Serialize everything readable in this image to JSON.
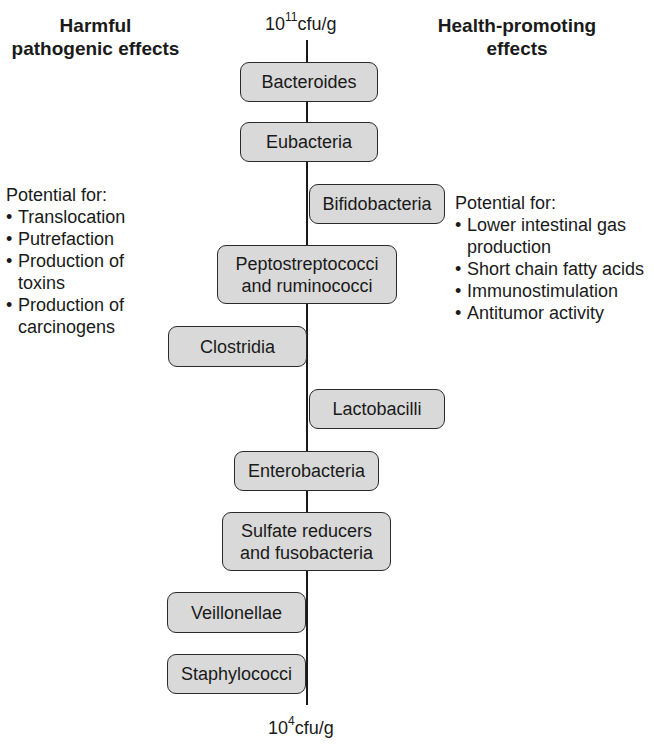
{
  "headings": {
    "left": "Harmful pathogenic effects",
    "right": "Health-promoting effects"
  },
  "axis": {
    "top": {
      "base": "10",
      "exp": "11",
      "unit": "cfu/g"
    },
    "bottom": {
      "base": "10",
      "exp": "4",
      "unit": "cfu/g"
    }
  },
  "bacteria": [
    {
      "label": "Bacteroides",
      "side": "center"
    },
    {
      "label": "Eubacteria",
      "side": "center"
    },
    {
      "label": "Bifidobacteria",
      "side": "right"
    },
    {
      "label": "Peptostreptococci and ruminococci",
      "side": "center"
    },
    {
      "label": "Clostridia",
      "side": "left"
    },
    {
      "label": "Lactobacilli",
      "side": "right"
    },
    {
      "label": "Enterobacteria",
      "side": "center"
    },
    {
      "label": "Sulfate reducers and fusobacteria",
      "side": "center"
    },
    {
      "label": "Veillonellae",
      "side": "left"
    },
    {
      "label": "Staphylococci",
      "side": "left"
    }
  ],
  "harmful": {
    "title": "Potential for:",
    "items": [
      "Translocation",
      "Putrefaction",
      "Production of toxins",
      "Production of carcinogens"
    ]
  },
  "beneficial": {
    "title": "Potential for:",
    "items": [
      "Lower intestinal gas production",
      "Short chain fatty acids",
      "Immunostimulation",
      "Antitumor activity"
    ]
  },
  "colors": {
    "box_fill": "#d9d9d9",
    "box_border": "#2a2a2a",
    "axis": "#1a1a1a"
  }
}
